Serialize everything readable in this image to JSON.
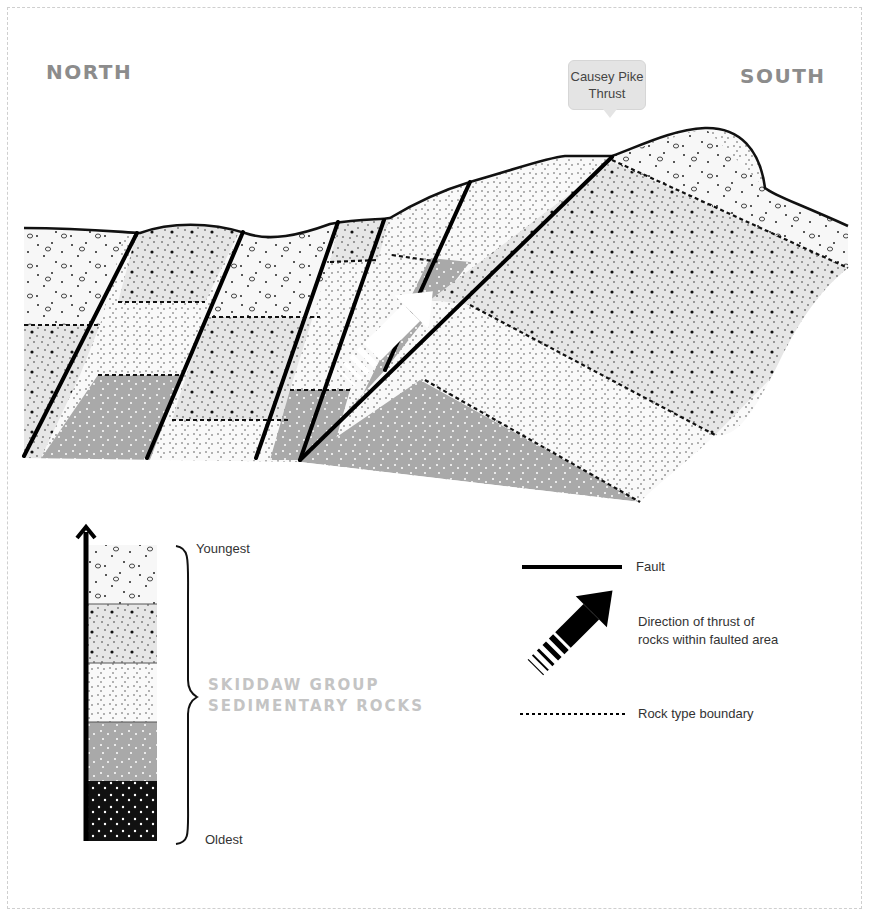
{
  "diagram": {
    "title_left": "NORTH",
    "title_right": "SOUTH",
    "callout": {
      "line1": "Causey Pike",
      "line2": "Thrust"
    },
    "layer_colors": {
      "layer1_youngest": "#f7f7f7",
      "layer2": "#e6e6e6",
      "layer3": "#f9f9f9",
      "layer4": "#a9a9a9",
      "layer5_oldest": "#111111",
      "fault": "#000000",
      "label_gray": "#8c8c8c",
      "group_label": "#c4c4c4"
    }
  },
  "legend": {
    "age_top": "Youngest",
    "age_bottom": "Oldest",
    "group_label_line1": "SKIDDAW GROUP",
    "group_label_line2": "SEDIMENTARY ROCKS",
    "items": [
      {
        "symbol": "solid-line",
        "label": "Fault"
      },
      {
        "symbol": "thrust-arrow",
        "label_line1": "Direction of thrust of",
        "label_line2": "rocks within faulted area"
      },
      {
        "symbol": "dotted-line",
        "label": "Rock type boundary"
      }
    ]
  }
}
